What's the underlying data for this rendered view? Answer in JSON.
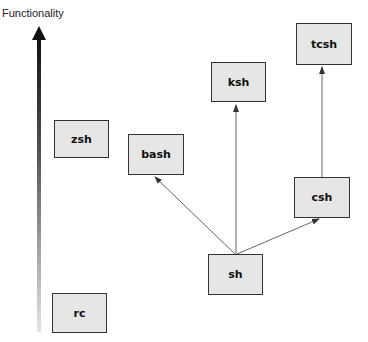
{
  "axis": {
    "label": "Functionality",
    "direction": "up"
  },
  "nodes": {
    "tcsh": {
      "label": "tcsh"
    },
    "ksh": {
      "label": "ksh"
    },
    "zsh": {
      "label": "zsh"
    },
    "bash": {
      "label": "bash"
    },
    "csh": {
      "label": "csh"
    },
    "sh": {
      "label": "sh"
    },
    "rc": {
      "label": "rc"
    }
  },
  "edges": [
    {
      "from": "sh",
      "to": "bash"
    },
    {
      "from": "sh",
      "to": "ksh"
    },
    {
      "from": "sh",
      "to": "csh"
    },
    {
      "from": "csh",
      "to": "tcsh"
    }
  ],
  "colors": {
    "node_fill": "#e6e6e6",
    "node_border": "#333333",
    "edge": "#555555"
  }
}
